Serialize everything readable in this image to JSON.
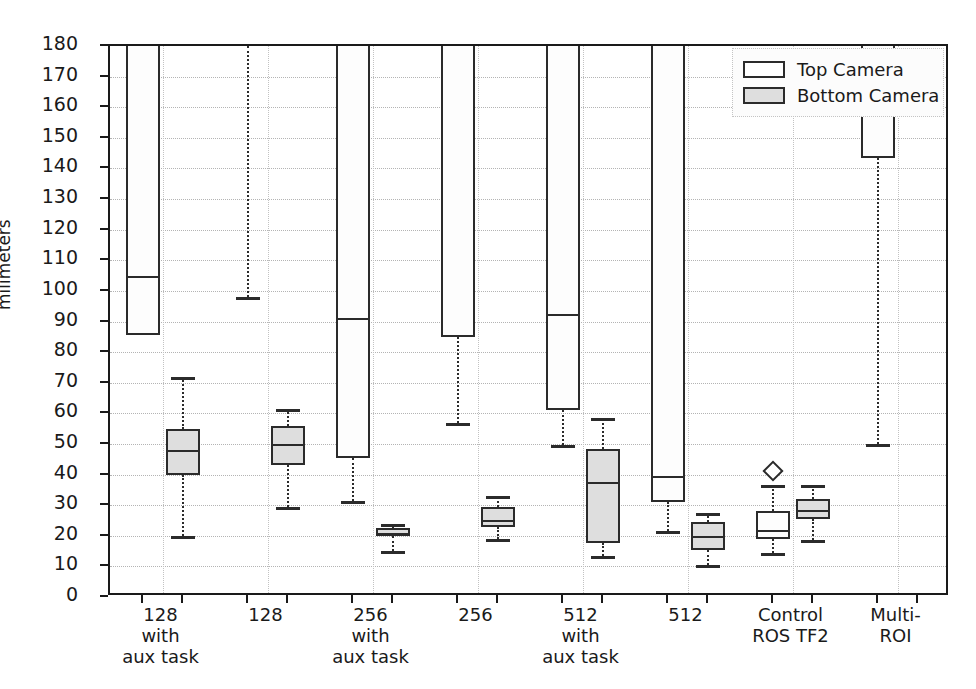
{
  "chart_data": {
    "type": "box",
    "title": "",
    "xlabel": "",
    "ylabel": "milimeters",
    "ylim": [
      0,
      180
    ],
    "ytick_labels": [
      "0",
      "10",
      "20",
      "30",
      "40",
      "50",
      "60",
      "70",
      "80",
      "90",
      "100",
      "110",
      "120",
      "130",
      "140",
      "150",
      "160",
      "170",
      "180"
    ],
    "ytick_values": [
      0,
      10,
      20,
      30,
      40,
      50,
      60,
      70,
      80,
      90,
      100,
      110,
      120,
      130,
      140,
      150,
      160,
      170,
      180
    ],
    "grid": true,
    "legend_position": "top-right",
    "legend": [
      {
        "name": "Top Camera",
        "fill": "#ffffff"
      },
      {
        "name": "Bottom Camera",
        "fill": "#dedede"
      }
    ],
    "categories": [
      "128\nwith\naux task",
      "128",
      "256\nwith\naux task",
      "256",
      "512\nwith\naux task",
      "512",
      "Control\nROS TF2",
      "Multi-ROI"
    ],
    "series": [
      {
        "name": "Top Camera",
        "boxes": [
          {
            "category": "128 with aux task",
            "q1": 85.5,
            "median": 105,
            "q3": 180,
            "whisker_low": null,
            "whisker_high": null,
            "clipped_top": true,
            "outliers": []
          },
          {
            "category": "128",
            "q1": null,
            "median": null,
            "q3": null,
            "whisker_low": 98,
            "whisker_high": null,
            "clipped_top": true,
            "outliers": []
          },
          {
            "category": "256 with aux task",
            "q1": 45.5,
            "median": 91,
            "q3": 180,
            "whisker_low": 31.5,
            "whisker_high": null,
            "clipped_top": true,
            "outliers": []
          },
          {
            "category": "256",
            "q1": 85,
            "median": null,
            "q3": 180,
            "whisker_low": 57,
            "whisker_high": null,
            "clipped_top": true,
            "outliers": []
          },
          {
            "category": "512 with aux task",
            "q1": 61,
            "median": 92.5,
            "q3": 180,
            "whisker_low": 49.5,
            "whisker_high": null,
            "clipped_top": true,
            "outliers": []
          },
          {
            "category": "512",
            "q1": 31,
            "median": 39.5,
            "q3": 180,
            "whisker_low": 21.5,
            "whisker_high": null,
            "clipped_top": true,
            "outliers": []
          },
          {
            "category": "Control ROS TF2",
            "q1": 19,
            "median": 22,
            "q3": 28,
            "whisker_low": 14.5,
            "whisker_high": 36.5,
            "clipped_top": false,
            "outliers": [
              41
            ]
          },
          {
            "category": "Multi-ROI",
            "q1": 143.5,
            "median": null,
            "q3": 180,
            "whisker_low": 50,
            "whisker_high": null,
            "clipped_top": true,
            "outliers": []
          }
        ]
      },
      {
        "name": "Bottom Camera",
        "boxes": [
          {
            "category": "128 with aux task",
            "q1": 40,
            "median": 48,
            "q3": 55,
            "whisker_low": 20,
            "whisker_high": 72,
            "clipped_top": false,
            "outliers": []
          },
          {
            "category": "128",
            "q1": 43,
            "median": 50,
            "q3": 56,
            "whisker_low": 29.5,
            "whisker_high": 61.5,
            "clipped_top": false,
            "outliers": []
          },
          {
            "category": "256 with aux task",
            "q1": 20,
            "median": 21,
            "q3": 22.5,
            "whisker_low": 15,
            "whisker_high": 24,
            "clipped_top": false,
            "outliers": []
          },
          {
            "category": "256",
            "q1": 23,
            "median": 25,
            "q3": 29.5,
            "whisker_low": 19,
            "whisker_high": 33,
            "clipped_top": false,
            "outliers": []
          },
          {
            "category": "512 with aux task",
            "q1": 17.5,
            "median": 37.5,
            "q3": 48.5,
            "whisker_low": 13.5,
            "whisker_high": 58.5,
            "clipped_top": false,
            "outliers": []
          },
          {
            "category": "512",
            "q1": 15.5,
            "median": 20,
            "q3": 24.5,
            "whisker_low": 10.5,
            "whisker_high": 27.5,
            "clipped_top": false,
            "outliers": []
          },
          {
            "category": "Control ROS TF2",
            "q1": 25.5,
            "median": 28.5,
            "q3": 32,
            "whisker_low": 18.5,
            "whisker_high": 36.5,
            "clipped_top": false,
            "outliers": []
          },
          {
            "category": "Multi-ROI",
            "q1": null,
            "median": null,
            "q3": null,
            "whisker_low": null,
            "whisker_high": null,
            "clipped_top": false,
            "outliers": []
          }
        ]
      }
    ]
  },
  "axis": {
    "y_title": "milimeters"
  },
  "legend": {
    "items": [
      {
        "label": "Top Camera"
      },
      {
        "label": "Bottom Camera"
      }
    ]
  }
}
